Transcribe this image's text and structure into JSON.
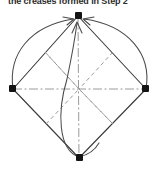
{
  "figure": {
    "caption": "the creases formed in Step 2",
    "alt_title": "Origami folding diagram: square rotated 45 degrees with creases and fold arrows",
    "background_color": "#ffffff",
    "line_color": "#3a3a3a",
    "crease_color": "#8a8a8a",
    "axis_color": "#9a9a9a",
    "vertex_color": "#1a1a1a",
    "vertices": [
      {
        "name": "top",
        "label": "top-vertex",
        "x": 78,
        "y": 16
      },
      {
        "name": "left",
        "label": "left-vertex",
        "x": 13,
        "y": 89
      },
      {
        "name": "right",
        "label": "right-vertex",
        "x": 146,
        "y": 89
      },
      {
        "name": "bottom",
        "label": "bottom-vertex",
        "x": 79,
        "y": 158
      }
    ],
    "edges": [
      {
        "name": "edge-top-left",
        "from": "top",
        "to": "left",
        "style": "solid"
      },
      {
        "name": "edge-top-right",
        "from": "top",
        "to": "right",
        "style": "solid"
      },
      {
        "name": "edge-left-bottom",
        "from": "left",
        "to": "bottom",
        "style": "solid"
      },
      {
        "name": "edge-right-bottom",
        "from": "right",
        "to": "bottom",
        "style": "solid"
      }
    ],
    "creases": [
      {
        "name": "crease-upper-left",
        "style": "dashed",
        "description": "midpoint crease upper-left quadrant"
      },
      {
        "name": "crease-upper-right",
        "style": "dashed",
        "description": "midpoint crease upper-right quadrant"
      },
      {
        "name": "crease-lower-left",
        "style": "dashed",
        "description": "midpoint crease lower-left quadrant"
      },
      {
        "name": "crease-lower-right",
        "style": "dashed",
        "description": "midpoint crease lower-right quadrant"
      },
      {
        "name": "axis-horizontal",
        "style": "dash-dot",
        "description": "horizontal centre axis left to right vertex"
      },
      {
        "name": "axis-vertical",
        "style": "dash-dot",
        "description": "vertical centre axis top to bottom vertex"
      }
    ],
    "fold_arrows": [
      {
        "name": "arrow-left-to-top",
        "from": "left",
        "to": "top",
        "curve": "bulge-left",
        "head": "at-top"
      },
      {
        "name": "arrow-right-to-top",
        "from": "right",
        "to": "top",
        "curve": "bulge-right",
        "head": "at-top"
      },
      {
        "name": "arrow-bottom-to-top",
        "from": "bottom",
        "to": "top",
        "curve": "bulge-left",
        "head": "at-top"
      }
    ],
    "arrow_count": 3,
    "vertex_count": 4
  }
}
